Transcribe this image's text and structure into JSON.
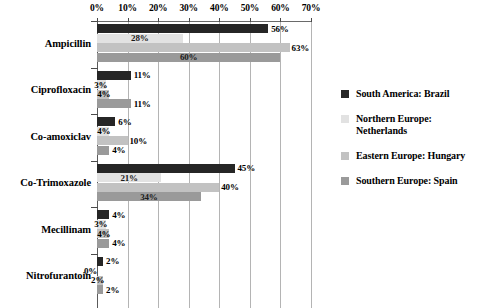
{
  "chart_data": {
    "type": "bar",
    "orientation": "horizontal",
    "title": "",
    "xlabel": "",
    "ylabel": "",
    "xlim": [
      0,
      70
    ],
    "xtick_labels": [
      "0%",
      "10%",
      "20%",
      "30%",
      "40%",
      "50%",
      "60%",
      "70%"
    ],
    "xtick_values": [
      0,
      10,
      20,
      30,
      40,
      50,
      60,
      70
    ],
    "grid": true,
    "legend_position": "right",
    "value_label_suffix": "%",
    "categories": [
      "Ampicillin",
      "Ciprofloxacin",
      "Co-amoxiclav",
      "Co-Trimoxazole",
      "Mecillinam",
      "Nitrofurantoin"
    ],
    "series": [
      {
        "name": "South America: Brazil",
        "color": "#262626",
        "values": [
          56,
          11,
          6,
          45,
          4,
          2
        ],
        "labels": [
          "56%",
          "11%",
          "6%",
          "45%",
          "4%",
          "2%"
        ]
      },
      {
        "name": "Northern Europe: Netherlands",
        "color": "#e2e2e2",
        "values": [
          28,
          3,
          4,
          21,
          3,
          0
        ],
        "labels": [
          "28%",
          "3%",
          "4%",
          "21%",
          "3%",
          "0%"
        ]
      },
      {
        "name": "Eastern Europe: Hungary",
        "color": "#c2c2c2",
        "values": [
          63,
          4,
          10,
          40,
          4,
          2
        ],
        "labels": [
          "63%",
          "4%",
          "10%",
          "40%",
          "4%",
          "2%"
        ]
      },
      {
        "name": "Southern Europe: Spain",
        "color": "#9a9a9a",
        "values": [
          60,
          11,
          4,
          34,
          4,
          2
        ],
        "labels": [
          "60%",
          "11%",
          "4%",
          "34%",
          "4%",
          "2%"
        ]
      }
    ],
    "legend_entries": [
      {
        "label": "South America: Brazil",
        "color": "#262626"
      },
      {
        "label": "Northern Europe: Netherlands",
        "color": "#e2e2e2"
      },
      {
        "label": "Eastern Europe: Hungary",
        "color": "#c2c2c2"
      },
      {
        "label": "Southern Europe: Spain",
        "color": "#9a9a9a"
      }
    ]
  }
}
